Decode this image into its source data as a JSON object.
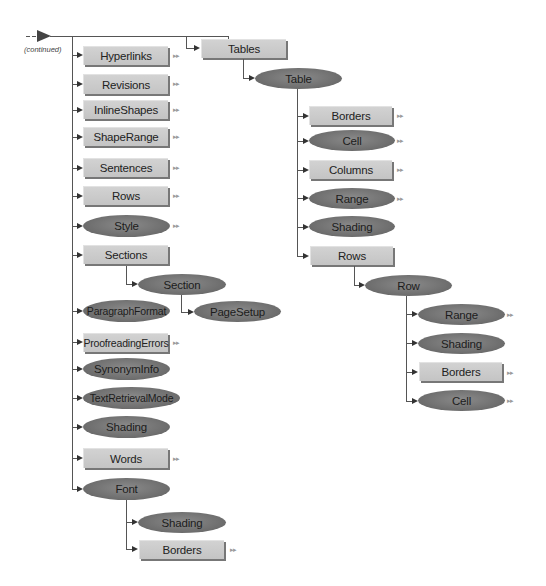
{
  "diagram": {
    "continued_label": "(continued)",
    "more_glyph": "▸▸",
    "colors": {
      "box_fill": "#c8c8c8",
      "ellipse_fill": "#707070",
      "line": "#555555",
      "more_arrow": "#9a9a9a"
    },
    "left_column": [
      {
        "label": "Hyperlinks",
        "shape": "box",
        "has_more": true
      },
      {
        "label": "Revisions",
        "shape": "box",
        "has_more": true
      },
      {
        "label": "InlineShapes",
        "shape": "box",
        "has_more": true
      },
      {
        "label": "ShapeRange",
        "shape": "box",
        "has_more": true
      },
      {
        "label": "Sentences",
        "shape": "box",
        "has_more": true
      },
      {
        "label": "Rows",
        "shape": "box",
        "has_more": true
      },
      {
        "label": "Style",
        "shape": "ellipse",
        "has_more": true
      },
      {
        "label": "Sections",
        "shape": "box",
        "has_more": false,
        "children": [
          {
            "label": "Section",
            "shape": "ellipse",
            "has_more": false,
            "children": [
              {
                "label": "PageSetup",
                "shape": "ellipse",
                "has_more": false
              }
            ]
          }
        ]
      },
      {
        "label": "ParagraphFormat",
        "shape": "ellipse",
        "has_more": false
      },
      {
        "label": "ProofreadingErrors",
        "shape": "box",
        "has_more": true
      },
      {
        "label": "SynonymInfo",
        "shape": "ellipse",
        "has_more": false
      },
      {
        "label": "TextRetrievalMode",
        "shape": "ellipse",
        "has_more": false
      },
      {
        "label": "Shading",
        "shape": "ellipse",
        "has_more": false
      },
      {
        "label": "Words",
        "shape": "box",
        "has_more": true
      },
      {
        "label": "Font",
        "shape": "ellipse",
        "has_more": false,
        "children": [
          {
            "label": "Shading",
            "shape": "ellipse",
            "has_more": false
          },
          {
            "label": "Borders",
            "shape": "box",
            "has_more": true
          }
        ]
      }
    ],
    "right_tree": {
      "label": "Tables",
      "shape": "box",
      "children": [
        {
          "label": "Table",
          "shape": "ellipse",
          "children": [
            {
              "label": "Borders",
              "shape": "box",
              "has_more": true
            },
            {
              "label": "Cell",
              "shape": "ellipse",
              "has_more": true
            },
            {
              "label": "Columns",
              "shape": "box",
              "has_more": true
            },
            {
              "label": "Range",
              "shape": "ellipse",
              "has_more": true
            },
            {
              "label": "Shading",
              "shape": "ellipse",
              "has_more": false
            },
            {
              "label": "Rows",
              "shape": "box",
              "has_more": false,
              "children": [
                {
                  "label": "Row",
                  "shape": "ellipse",
                  "children": [
                    {
                      "label": "Range",
                      "shape": "ellipse",
                      "has_more": true
                    },
                    {
                      "label": "Shading",
                      "shape": "ellipse",
                      "has_more": false
                    },
                    {
                      "label": "Borders",
                      "shape": "box",
                      "has_more": true
                    },
                    {
                      "label": "Cell",
                      "shape": "ellipse",
                      "has_more": true
                    }
                  ]
                }
              ]
            }
          ]
        }
      ]
    }
  }
}
